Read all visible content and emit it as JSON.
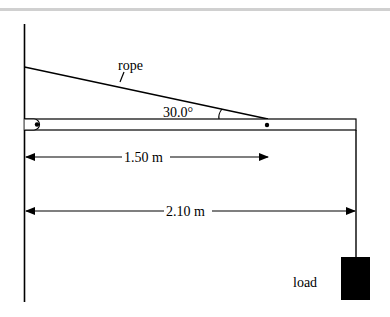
{
  "diagram": {
    "type": "statics-beam-rope",
    "labels": {
      "rope": "rope",
      "angle": "30.0°",
      "dim1": "1.50 m",
      "dim2": "2.10 m",
      "load": "load"
    },
    "colors": {
      "line": "#000000",
      "background": "#ffffff",
      "top_border": "#d0d0d0"
    }
  }
}
